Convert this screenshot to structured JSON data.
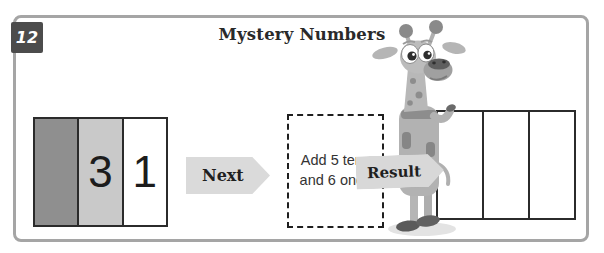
{
  "panel": {
    "background": "#ffffff",
    "border_color": "#a5a5a5"
  },
  "badge": {
    "number": "12",
    "background": "#4c4c4c",
    "text_color": "#ffffff"
  },
  "title": {
    "text": "Mystery Numbers",
    "color": "#2a2a2a"
  },
  "place_value_box": {
    "border_color": "#2b2b2b",
    "columns": [
      {
        "name": "hundreds",
        "value": "",
        "background": "#8f8f8f"
      },
      {
        "name": "tens",
        "value": "3",
        "background": "#c9c9c9"
      },
      {
        "name": "ones",
        "value": "1",
        "background": "#ffffff"
      }
    ]
  },
  "next_button": {
    "label": "Next",
    "background": "#dadada",
    "text_color": "#1f1f1f"
  },
  "instruction_box": {
    "line1": "Add 5 tens",
    "line2": "and 6 ones",
    "text_color": "#333333"
  },
  "result_label": {
    "label": "Result",
    "background": "#d8d8d8",
    "text_color": "#1f1f1f"
  },
  "result_box": {
    "border_color": "#2b2b2b",
    "columns": [
      {
        "name": "hundreds",
        "value": ""
      },
      {
        "name": "tens",
        "value": ""
      },
      {
        "name": "ones",
        "value": ""
      }
    ]
  },
  "mascot": {
    "type": "giraffe"
  }
}
